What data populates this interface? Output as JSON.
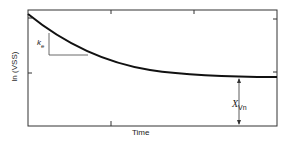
{
  "diagram": {
    "ylabel": "ln (VSS)",
    "xlabel": "Time",
    "slope_label": {
      "main": "k",
      "sub": "e"
    },
    "gap_label": {
      "main": "X",
      "sub": "Vn"
    }
  }
}
